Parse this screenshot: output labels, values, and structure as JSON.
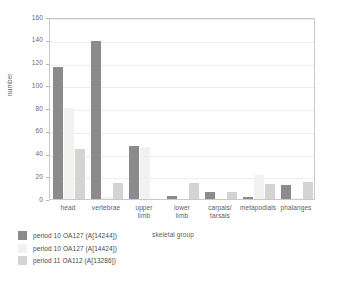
{
  "chart_data": {
    "type": "bar",
    "title": "",
    "xlabel": "skeletal group",
    "ylabel": "number",
    "ylim": [
      0,
      160
    ],
    "ytick_step": 20,
    "yticks": [
      0,
      20,
      40,
      60,
      80,
      100,
      120,
      140,
      160
    ],
    "grid": true,
    "legend_position": "bottom-left",
    "categories": [
      "head",
      "vertebrae",
      "upper limb",
      "lower limb",
      "carpals/ tarsals",
      "metapodials",
      "phalanges"
    ],
    "series": [
      {
        "name": "period 10 OA127 (A[14244])",
        "color": "#8d8a8d",
        "values": [
          116,
          139,
          47,
          3,
          6,
          2,
          12
        ]
      },
      {
        "name": "period 10 OA127 (A[14424])",
        "color": "#f2f2f0",
        "values": [
          80,
          2,
          46,
          0,
          0,
          21,
          1
        ]
      },
      {
        "name": "period 11 OA112 (A[13286])",
        "color": "#d4d4d2",
        "values": [
          44,
          14,
          0,
          14,
          6,
          13,
          15
        ]
      }
    ]
  },
  "axis": {
    "y_title": "number",
    "x_title": "skeletal group"
  }
}
